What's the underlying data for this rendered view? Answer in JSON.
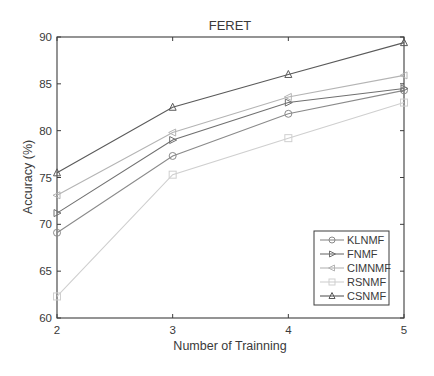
{
  "chart_data": {
    "type": "line",
    "title": "FERET",
    "xlabel": "Number of Trainning",
    "ylabel": "Accuracy (%)",
    "x": [
      2,
      3,
      4,
      5
    ],
    "xticks": [
      "2",
      "3",
      "4",
      "5"
    ],
    "xlim": [
      2,
      5
    ],
    "ylim": [
      60,
      90
    ],
    "yticks": [
      "60",
      "65",
      "70",
      "75",
      "80",
      "85",
      "90"
    ],
    "grid": false,
    "legend_position": "lower right",
    "series": [
      {
        "name": "KLNMF",
        "marker": "circle",
        "color": "#8a8a8a",
        "values": [
          69.1,
          77.3,
          81.8,
          84.3
        ]
      },
      {
        "name": "FNMF",
        "marker": "triangle-right",
        "color": "#707070",
        "values": [
          71.2,
          79.0,
          83.0,
          84.5
        ]
      },
      {
        "name": "CIMNMF",
        "marker": "triangle-left",
        "color": "#b4b4b4",
        "values": [
          73.1,
          79.8,
          83.6,
          85.9
        ]
      },
      {
        "name": "RSNMF",
        "marker": "square",
        "color": "#cfcfcf",
        "values": [
          62.3,
          75.3,
          79.2,
          83.0
        ]
      },
      {
        "name": "CSNMF",
        "marker": "triangle-up",
        "color": "#5a5a5a",
        "values": [
          75.5,
          82.5,
          86.0,
          89.4
        ]
      }
    ]
  }
}
